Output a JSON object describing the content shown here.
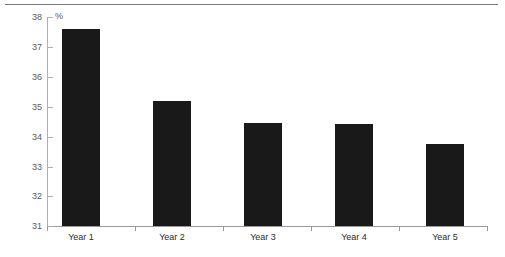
{
  "chart_data": {
    "type": "bar",
    "title": "",
    "subtitle": "",
    "xlabel": "",
    "ylabel": "%",
    "unit_label": "%",
    "categories": [
      "Year 1",
      "Year 2",
      "Year 3",
      "Year 4",
      "Year 5"
    ],
    "values": [
      37.6,
      35.2,
      34.45,
      34.4,
      33.75
    ],
    "ylim": [
      31,
      38
    ],
    "ytick_labels": [
      "38",
      "37",
      "36",
      "35",
      "34",
      "33",
      "32",
      "31"
    ],
    "yticks": [
      38,
      37,
      36,
      35,
      34,
      33,
      32,
      31
    ],
    "grid": false,
    "legend": null,
    "series": [
      {
        "name": "",
        "values": [
          37.6,
          35.2,
          34.45,
          34.4,
          33.75
        ]
      }
    ],
    "colors": {
      "bar": "#191919",
      "axis": "#9a9a9a",
      "tick_label": "#59595b",
      "top_rule": "#7a7a7a",
      "background": "#ffffff"
    }
  }
}
